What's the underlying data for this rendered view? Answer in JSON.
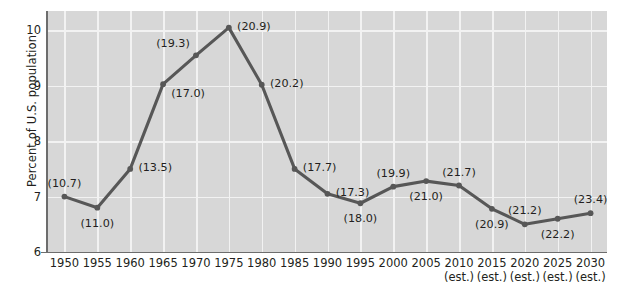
{
  "chart_data": {
    "type": "line",
    "title": "",
    "xlabel": "",
    "ylabel": "Percent of U.S. population",
    "ylim": [
      6,
      10.35
    ],
    "yticks": [
      6,
      7,
      8,
      9,
      10
    ],
    "ytick_labels": [
      "6",
      "7",
      "8",
      "9",
      "10"
    ],
    "grid": true,
    "legend": "none",
    "categories": [
      "1950",
      "1955",
      "1960",
      "1965",
      "1970",
      "1975",
      "1980",
      "1985",
      "1990",
      "1995",
      "2000",
      "2005",
      "2010",
      "2015",
      "2020",
      "2025",
      "2030"
    ],
    "category_notes": [
      "",
      "",
      "",
      "",
      "",
      "",
      "",
      "",
      "",
      "",
      "",
      "",
      "(est.)",
      "(est.)",
      "(est.)",
      "(est.)",
      "(est.)"
    ],
    "values": [
      7.0,
      6.8,
      7.5,
      9.03,
      9.55,
      10.05,
      9.02,
      7.5,
      7.05,
      6.88,
      7.18,
      7.28,
      7.2,
      6.78,
      6.5,
      6.6,
      6.7
    ],
    "point_labels": [
      "(10.7)",
      "(11.0)",
      "(13.5)",
      "(17.0)",
      "(19.3)",
      "(20.9)",
      "(20.2)",
      "(17.7)",
      "(17.3)",
      "(18.0)",
      "(19.9)",
      "(21.0)",
      "(21.7)",
      "(20.9)",
      "(21.2)",
      "(22.2)",
      "(23.4)"
    ],
    "label_positions": [
      "above",
      "below",
      "right",
      "below-right",
      "above-left",
      "right",
      "right",
      "right",
      "right",
      "below",
      "above",
      "below",
      "above",
      "below",
      "above",
      "below",
      "above"
    ],
    "colors": {
      "line": "#575757",
      "marker": "#575757",
      "plot_background": "#d7d7d7",
      "gridline": "#f2f2f2",
      "axis": "#6d6d6d",
      "text": "#231f20"
    }
  }
}
